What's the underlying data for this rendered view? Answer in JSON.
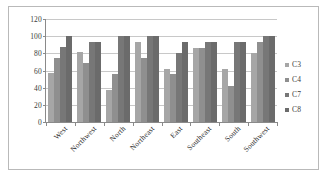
{
  "chart_data": {
    "type": "bar",
    "title": "",
    "subtitle": "",
    "xlabel": "",
    "ylabel": "",
    "ylim": [
      0,
      120
    ],
    "yticks": [
      0,
      20,
      40,
      60,
      80,
      100,
      120
    ],
    "grid": true,
    "legend_position": "right",
    "categories": [
      "West",
      "Northwest",
      "North",
      "Northeast",
      "East",
      "Southeast",
      "South",
      "Southwest"
    ],
    "series": [
      {
        "name": "C3",
        "color": "#a6a6a6",
        "values": [
          57,
          81,
          37,
          93,
          62,
          86,
          62,
          80
        ]
      },
      {
        "name": "C4",
        "color": "#8f8f8f",
        "values": [
          74,
          69,
          56,
          74,
          56,
          86,
          42,
          93
        ]
      },
      {
        "name": "C7",
        "color": "#777777",
        "values": [
          87,
          93,
          100,
          100,
          80,
          93,
          93,
          100
        ]
      },
      {
        "name": "C8",
        "color": "#6b6b6b",
        "values": [
          100,
          93,
          100,
          100,
          93,
          93,
          93,
          100
        ]
      }
    ]
  },
  "legend": {
    "items": [
      {
        "label": "C3"
      },
      {
        "label": "C4"
      },
      {
        "label": "C7"
      },
      {
        "label": "C8"
      }
    ]
  },
  "axes": {
    "y_tick_labels": [
      "0",
      "20",
      "40",
      "60",
      "80",
      "100",
      "120"
    ],
    "x_tick_labels": [
      "West",
      "Northwest",
      "North",
      "Northeast",
      "East",
      "Southeast",
      "South",
      "Southwest"
    ]
  },
  "colors": {
    "plot_background": "#ffffff",
    "gridline": "#c8c8c8",
    "axis_line": "#8a8a8a",
    "frame_border": "#b9b9b9",
    "text": "#3a3a3a"
  }
}
